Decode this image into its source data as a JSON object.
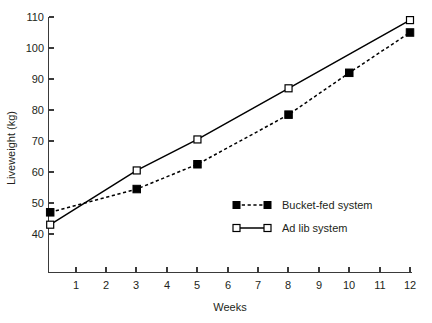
{
  "chart_data": {
    "type": "line",
    "title": "",
    "xlabel": "Weeks",
    "ylabel": "Liveweight (kg)",
    "xlim": [
      0,
      12.4
    ],
    "ylim": [
      36,
      112
    ],
    "xticks": [
      1,
      2,
      3,
      4,
      5,
      6,
      7,
      8,
      9,
      10,
      11,
      12
    ],
    "yticks": [
      40,
      50,
      60,
      70,
      80,
      90,
      100,
      110
    ],
    "grid": false,
    "legend_position": "inside-lower-right",
    "series": [
      {
        "name": "Bucket-fed system",
        "marker": "filled-square",
        "linestyle": "dashed",
        "color": "#000000",
        "x": [
          0.15,
          3,
          5,
          8,
          10,
          12
        ],
        "values": [
          47,
          54.5,
          62.5,
          78.5,
          92,
          105
        ]
      },
      {
        "name": "Ad lib system",
        "marker": "open-square",
        "linestyle": "solid",
        "color": "#000000",
        "x": [
          0.15,
          3,
          5,
          8,
          12
        ],
        "values": [
          43,
          60.5,
          70.5,
          87,
          109
        ]
      }
    ]
  },
  "axes": {
    "y_title": "Liveweight (kg)",
    "x_title": "Weeks",
    "y_tick_labels": [
      "110",
      "100",
      "90",
      "80",
      "70",
      "60",
      "50",
      "40"
    ],
    "x_tick_labels": [
      "1",
      "2",
      "3",
      "4",
      "5",
      "6",
      "7",
      "8",
      "9",
      "10",
      "11",
      "12"
    ]
  },
  "legend": {
    "entries": [
      {
        "label": "Bucket-fed system",
        "marker": "filled-square",
        "linestyle": "dashed"
      },
      {
        "label": "Ad lib system",
        "marker": "open-square",
        "linestyle": "solid"
      }
    ]
  },
  "colors": {
    "background": "#ffffff",
    "axis": "#3a3a3a",
    "text": "#231f20",
    "series": "#000000"
  }
}
